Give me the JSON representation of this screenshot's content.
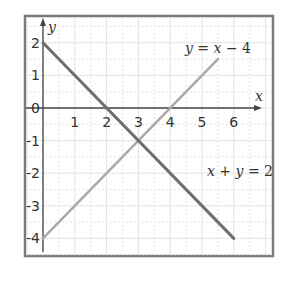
{
  "chart_data": {
    "type": "line",
    "title": "",
    "xlabel": "x",
    "ylabel": "y",
    "xlim": [
      0,
      6.6
    ],
    "ylim": [
      -4.4,
      2.3
    ],
    "grid": true,
    "grid_minor_step": 0.5,
    "x_ticks": [
      1,
      2,
      3,
      4,
      5,
      6
    ],
    "y_ticks": [
      2,
      1,
      0,
      -1,
      -2,
      -3,
      -4
    ],
    "series": [
      {
        "name": "x + y = 2",
        "label_parts": [
          "x",
          " + ",
          "y",
          " = 2"
        ],
        "color": "#6e6e6e",
        "width": 3,
        "points": [
          [
            0,
            2
          ],
          [
            6,
            -4
          ]
        ]
      },
      {
        "name": "y = x − 4",
        "label_parts": [
          "y",
          " = ",
          "x",
          " − 4"
        ],
        "color": "#a9a9a9",
        "width": 2.5,
        "points": [
          [
            0,
            -4
          ],
          [
            5.5,
            1.5
          ]
        ]
      }
    ],
    "intersection": [
      3,
      -1
    ],
    "annotations": [
      {
        "text": "y = x − 4",
        "near": [
          5,
          1.9
        ]
      },
      {
        "text": "x + y = 2",
        "near": [
          5.1,
          -2.2
        ]
      }
    ]
  },
  "colors": {
    "frame": "#7a7a7a",
    "grid": "#e3e3e3",
    "axis": "#444444"
  }
}
